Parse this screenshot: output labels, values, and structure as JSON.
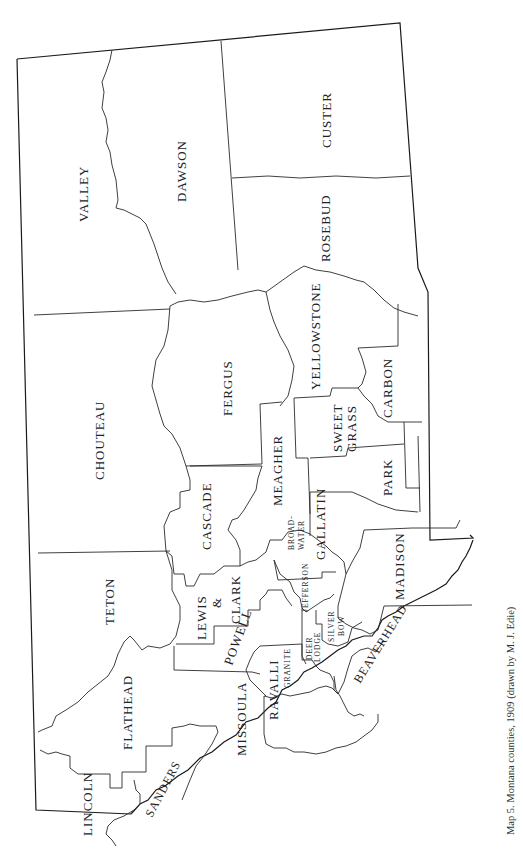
{
  "caption": "Map 5. Montana counties, 1909 (drawn by M. J. Edie)",
  "map": {
    "title": "Montana counties, 1909",
    "orientation": "rotated 90° counter-clockwise (north at left)",
    "counties": [
      {
        "name": "VALLEY",
        "label": "VALLEY"
      },
      {
        "name": "DAWSON",
        "label": "DAWSON"
      },
      {
        "name": "CUSTER",
        "label": "CUSTER"
      },
      {
        "name": "ROSEBUD",
        "label": "ROSEBUD"
      },
      {
        "name": "CHOUTEAU",
        "label": "CHOUTEAU"
      },
      {
        "name": "FERGUS",
        "label": "FERGUS"
      },
      {
        "name": "YELLOWSTONE",
        "label": "YELLOWSTONE"
      },
      {
        "name": "CARBON",
        "label": "CARBON"
      },
      {
        "name": "SWEET GRASS",
        "label_line1": "SWEET",
        "label_line2": "GRASS"
      },
      {
        "name": "MEAGHER",
        "label": "MEAGHER"
      },
      {
        "name": "PARK",
        "label": "PARK"
      },
      {
        "name": "CASCADE",
        "label": "CASCADE"
      },
      {
        "name": "GALLATIN",
        "label": "GALLATIN"
      },
      {
        "name": "BROADWATER",
        "label_line1": "BROAD-",
        "label_line2": "WATER"
      },
      {
        "name": "TETON",
        "label": "TETON"
      },
      {
        "name": "LEWIS & CLARK",
        "label_line1": "LEWIS",
        "label_line2": "&",
        "label_line3": "CLARK"
      },
      {
        "name": "JEFFERSON",
        "label": "JEFFERSON"
      },
      {
        "name": "MADISON",
        "label": "MADISON"
      },
      {
        "name": "POWELL",
        "label": "POWELL"
      },
      {
        "name": "SILVER BOW",
        "label_line1": "SILVER",
        "label_line2": "BOW"
      },
      {
        "name": "DEER LODGE",
        "label_line1": "DEER",
        "label_line2": "LODGE"
      },
      {
        "name": "BEAVERHEAD",
        "label": "BEAVERHEAD"
      },
      {
        "name": "GRANITE",
        "label": "GRANITE"
      },
      {
        "name": "FLATHEAD",
        "label": "FLATHEAD"
      },
      {
        "name": "MISSOULA",
        "label": "MISSOULA"
      },
      {
        "name": "RAVALLI",
        "label": "RAVALLI"
      },
      {
        "name": "SANDERS",
        "label": "SANDERS"
      },
      {
        "name": "LINCOLN",
        "label": "LINCOLN"
      }
    ],
    "colors": {
      "background": "#ffffff",
      "lines": "#2a2a2a",
      "text": "#222222"
    }
  }
}
